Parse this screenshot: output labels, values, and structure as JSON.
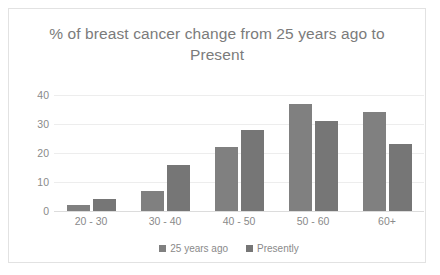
{
  "chart_data": {
    "type": "bar",
    "title": "% of breast cancer change from 25 years ago to Present",
    "xlabel": "",
    "ylabel": "",
    "categories": [
      "20 - 30",
      "30 - 40",
      "40 - 50",
      "50 - 60",
      "60+"
    ],
    "series": [
      {
        "name": "25 years ago",
        "color": "#808080",
        "values": [
          2,
          7,
          22,
          37,
          34
        ]
      },
      {
        "name": "Presently",
        "color": "#767676",
        "values": [
          4,
          16,
          28,
          31,
          23
        ]
      }
    ],
    "yticks": [
      0,
      10,
      20,
      30,
      40
    ],
    "ylim": [
      0,
      40
    ],
    "grid": true,
    "legend_position": "bottom"
  },
  "legend": {
    "items": [
      {
        "label": "25 years ago",
        "color": "#808080"
      },
      {
        "label": "Presently",
        "color": "#767676"
      }
    ]
  }
}
